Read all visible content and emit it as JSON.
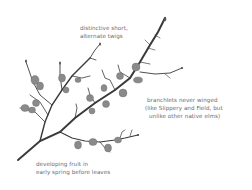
{
  "illustration": {
    "subject": "elm twig with developing fruit",
    "colors": {
      "branch": "#3a3a3a",
      "fruit": "#8a8a8a",
      "fruit_stroke": "#6a6a6a",
      "text": "#6b6b6b",
      "background": "#ffffff"
    }
  },
  "annotations": {
    "twigs": {
      "lines": [
        "distinctive short,",
        "alternate twigs"
      ]
    },
    "branchlets": {
      "lines": [
        "branchlets never winged",
        "(like Slippery and Field, but",
        "unlike other native elms)"
      ]
    },
    "fruit": {
      "lines": [
        "developing fruit in",
        "early spring before leaves"
      ]
    }
  }
}
